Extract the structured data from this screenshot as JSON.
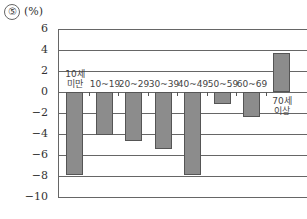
{
  "chart_data": {
    "type": "bar",
    "title": "⑤ (%)",
    "title_number": "⑤",
    "unit": "(%)",
    "categories": [
      "10세 미만",
      "10~19",
      "20~29",
      "30~39",
      "40~49",
      "50~59",
      "60~69",
      "70세 이상"
    ],
    "category_lines": [
      [
        "10세",
        "미만"
      ],
      [
        "10~19"
      ],
      [
        "20~29"
      ],
      [
        "30~39"
      ],
      [
        "40~49"
      ],
      [
        "50~59"
      ],
      [
        "60~69"
      ],
      [
        "70세",
        "이상"
      ]
    ],
    "values": [
      -7.9,
      -4.1,
      -4.7,
      -5.4,
      -7.9,
      -1.1,
      -2.4,
      3.7
    ],
    "xlabel": "",
    "ylabel": "%",
    "ylim": [
      -10,
      6
    ],
    "yticks": [
      "6",
      "4",
      "2",
      "0",
      "−2",
      "−4",
      "−6",
      "−8",
      "−10"
    ],
    "grid": true,
    "legend": null,
    "bar_color": "#8c8c8c"
  }
}
